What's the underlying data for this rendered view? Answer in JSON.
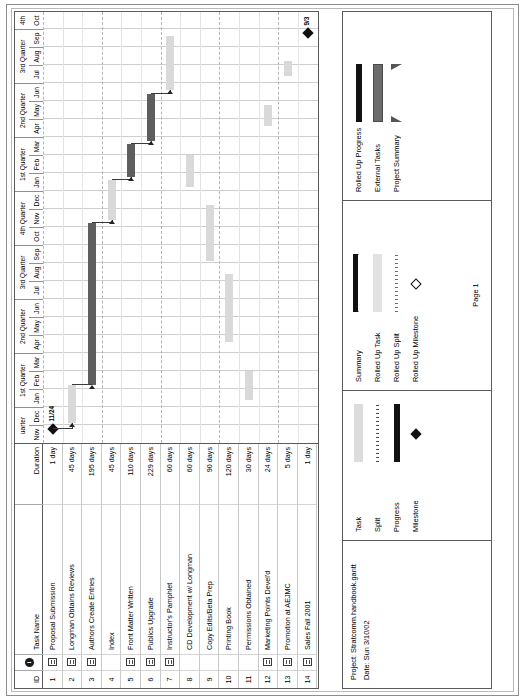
{
  "project": {
    "project_line": "Project: Stratcomm.handbook.gantt",
    "date_line": "Date: Sun 3/10/02",
    "page_label": "Page 1"
  },
  "table": {
    "headers": {
      "id": "ID",
      "info_icon": "info-icon",
      "name": "Task Name",
      "duration": "Duration"
    },
    "rows": [
      {
        "id": "1",
        "has_note": true,
        "name": "Proposal Submission",
        "duration": "1 day"
      },
      {
        "id": "2",
        "has_note": true,
        "name": "Longman Obtains Reviews",
        "duration": "45 days"
      },
      {
        "id": "3",
        "has_note": true,
        "name": "Authors Create Entries",
        "duration": "195 days"
      },
      {
        "id": "4",
        "has_note": false,
        "name": "Index",
        "duration": "45 days"
      },
      {
        "id": "5",
        "has_note": true,
        "name": "Front Matter Written",
        "duration": "110 days"
      },
      {
        "id": "6",
        "has_note": true,
        "name": "Publics Upgrade",
        "duration": "229 days"
      },
      {
        "id": "7",
        "has_note": true,
        "name": "Instructor's Pamphlet",
        "duration": "60 days"
      },
      {
        "id": "8",
        "has_note": false,
        "name": "CD Development w/ Longman",
        "duration": "60 days"
      },
      {
        "id": "9",
        "has_note": false,
        "name": "Copy Edits/Beta Prep",
        "duration": "90 days"
      },
      {
        "id": "10",
        "has_note": false,
        "name": "Printing Book",
        "duration": "120 days"
      },
      {
        "id": "11",
        "has_note": false,
        "name": "Permissions Obtained",
        "duration": "30 days"
      },
      {
        "id": "12",
        "has_note": true,
        "name": "Marketing Points Devel'd",
        "duration": "24 days"
      },
      {
        "id": "13",
        "has_note": true,
        "name": "Promotion at AEJMC",
        "duration": "5 days"
      },
      {
        "id": "14",
        "has_note": true,
        "name": "Sales Fall 2001",
        "duration": "1 day"
      }
    ]
  },
  "timescale": {
    "quarters": [
      {
        "label": "uarter",
        "months": 2
      },
      {
        "label": "1st Quarter",
        "months": 3
      },
      {
        "label": "2nd Quarter",
        "months": 3
      },
      {
        "label": "3rd Quarter",
        "months": 3
      },
      {
        "label": "4th Quarter",
        "months": 3
      },
      {
        "label": "1st Quarter",
        "months": 3
      },
      {
        "label": "2nd Quarter",
        "months": 3
      },
      {
        "label": "3rd Quarter",
        "months": 3
      },
      {
        "label": "4th",
        "months": 1
      }
    ],
    "months": [
      "Nov",
      "Dec",
      "Jan",
      "Feb",
      "Mar",
      "Apr",
      "May",
      "Jun",
      "Jul",
      "Aug",
      "Sep",
      "Oct",
      "Nov",
      "Dec",
      "Jan",
      "Feb",
      "Mar",
      "Apr",
      "May",
      "Jun",
      "Jul",
      "Aug",
      "Sep",
      "Oct"
    ]
  },
  "chart_data": {
    "type": "bar",
    "title": "Stratcomm.handbook.gantt",
    "xlabel": "",
    "ylabel": "",
    "month_count": 24,
    "start_month_label": "Nov",
    "categories": [
      "Proposal Submission",
      "Longman Obtains Reviews",
      "Authors Create Entries",
      "Index",
      "Front Matter Written",
      "Publics Upgrade",
      "Instructor's Pamphlet",
      "CD Development w/ Longman",
      "Copy Edits/Beta Prep",
      "Printing Book",
      "Permissions Obtained",
      "Marketing Points Devel'd",
      "Promotion at AEJMC",
      "Sales Fall 2001"
    ],
    "bars": [
      {
        "row": 1,
        "kind": "milestone",
        "start_month": 0.8,
        "label": "11/24"
      },
      {
        "row": 2,
        "kind": "task",
        "start_month": 1.1,
        "end_month": 3.2
      },
      {
        "row": 3,
        "kind": "progress",
        "start_month": 3.2,
        "end_month": 12.2
      },
      {
        "row": 4,
        "kind": "task",
        "start_month": 12.4,
        "end_month": 14.6
      },
      {
        "row": 5,
        "kind": "progress",
        "start_month": 14.8,
        "end_month": 16.6
      },
      {
        "row": 6,
        "kind": "progress",
        "start_month": 16.8,
        "end_month": 19.4
      },
      {
        "row": 7,
        "kind": "task",
        "start_month": 19.6,
        "end_month": 22.6
      },
      {
        "row": 8,
        "kind": "task",
        "start_month": 14.2,
        "end_month": 16.0
      },
      {
        "row": 9,
        "kind": "task",
        "start_month": 10.1,
        "end_month": 13.2
      },
      {
        "row": 10,
        "kind": "task",
        "start_month": 5.6,
        "end_month": 9.4
      },
      {
        "row": 11,
        "kind": "task",
        "start_month": 2.4,
        "end_month": 4.0
      },
      {
        "row": 12,
        "kind": "task",
        "start_month": 17.6,
        "end_month": 18.8
      },
      {
        "row": 13,
        "kind": "task",
        "start_month": 20.4,
        "end_month": 21.2
      },
      {
        "row": 14,
        "kind": "milestone",
        "start_month": 22.8,
        "label": "9/3"
      }
    ],
    "milestone_labels": [
      "11/24",
      "9/3"
    ],
    "grid": true,
    "legend_position": "bottom"
  },
  "legend": {
    "columns": [
      {
        "items": [
          {
            "label": "Task",
            "swatch": "task-bar-swatch"
          },
          {
            "label": "Split",
            "swatch": "split-bar-swatch"
          },
          {
            "label": "Progress",
            "swatch": "progress-bar-swatch"
          },
          {
            "label": "Milestone",
            "swatch": "milestone-diamond-swatch"
          }
        ]
      },
      {
        "items": [
          {
            "label": "Summary",
            "swatch": "summary-bar-swatch"
          },
          {
            "label": "Rolled Up Task",
            "swatch": "rolled-up-task-swatch"
          },
          {
            "label": "Rolled Up Split",
            "swatch": "rolled-up-split-swatch"
          },
          {
            "label": "Rolled Up Milestone",
            "swatch": "rolled-up-milestone-swatch"
          }
        ]
      },
      {
        "items": [
          {
            "label": "Rolled Up Progress",
            "swatch": "rolled-up-progress-swatch"
          },
          {
            "label": "External Tasks",
            "swatch": "external-tasks-swatch"
          },
          {
            "label": "Project Summary",
            "swatch": "project-summary-swatch"
          }
        ]
      }
    ]
  },
  "colors": {
    "task_bar": "#d9d9d9",
    "progress_bar": "#5e5e5e",
    "milestone": "#111111",
    "grid_line": "#b5b5b5",
    "border": "#5a5a5a"
  }
}
